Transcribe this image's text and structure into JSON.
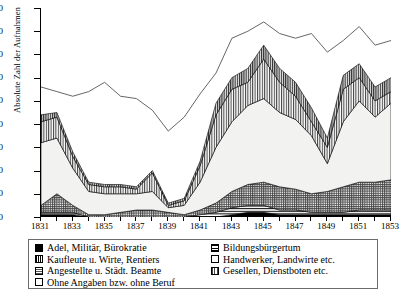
{
  "chart_data": {
    "type": "area",
    "title": "",
    "xlabel": "",
    "ylabel": "Absolute Zahl der Aufnahmen",
    "ylim": [
      0,
      90
    ],
    "yticks": [
      0,
      10,
      20,
      30,
      40,
      50,
      60,
      70,
      80,
      90
    ],
    "xlim": [
      1831,
      1853
    ],
    "x": [
      1831,
      1832,
      1833,
      1834,
      1835,
      1836,
      1837,
      1838,
      1839,
      1840,
      1841,
      1842,
      1843,
      1844,
      1845,
      1846,
      1847,
      1848,
      1849,
      1850,
      1851,
      1852,
      1853
    ],
    "xticks": [
      1831,
      1833,
      1835,
      1837,
      1839,
      1841,
      1843,
      1845,
      1847,
      1849,
      1851,
      1853
    ],
    "xticklabels": [
      "1831",
      "1833",
      "1835",
      "1837",
      "1839",
      "1841",
      "1843",
      "1845",
      "1847",
      "1849",
      "1851",
      "1853"
    ],
    "stacked": true,
    "grid": false,
    "legend_position": "below",
    "series": [
      {
        "name": "Adel, Militär, Bürokratie",
        "pattern": "solid-black",
        "values": [
          1,
          1,
          1,
          0,
          0,
          0,
          0,
          0,
          0,
          0,
          0,
          0,
          1,
          2,
          2,
          1,
          1,
          1,
          1,
          1,
          1,
          1,
          1
        ]
      },
      {
        "name": "Bildungsbürgertum",
        "pattern": "horizontal-lines",
        "values": [
          1,
          1,
          1,
          0,
          0,
          0,
          0,
          0,
          0,
          0,
          1,
          2,
          3,
          3,
          3,
          2,
          2,
          1,
          1,
          1,
          2,
          2,
          2
        ]
      },
      {
        "name": "Angestellte u. Städt. Beamte",
        "pattern": "fine-cross-hatch",
        "values": [
          3,
          8,
          3,
          1,
          1,
          2,
          3,
          3,
          2,
          1,
          2,
          4,
          7,
          9,
          10,
          10,
          9,
          8,
          9,
          11,
          12,
          12,
          13
        ]
      },
      {
        "name": "Handwerker, Landwirte etc.",
        "pattern": "white",
        "values": [
          27,
          24,
          16,
          10,
          9,
          8,
          7,
          8,
          2,
          4,
          12,
          24,
          30,
          34,
          36,
          32,
          30,
          25,
          12,
          28,
          35,
          28,
          33
        ]
      },
      {
        "name": "Gesellen, Dienstboten etc.",
        "pattern": "vertical-lines",
        "values": [
          9,
          9,
          5,
          3,
          3,
          3,
          2,
          8,
          1,
          2,
          7,
          14,
          14,
          10,
          17,
          13,
          10,
          6,
          7,
          14,
          10,
          7,
          5
        ]
      },
      {
        "name": "Kaufleute u. Wirte, Rentiers",
        "pattern": "vertical-lines-dark",
        "values": [
          3,
          2,
          2,
          1,
          1,
          1,
          1,
          1,
          1,
          1,
          2,
          5,
          5,
          6,
          6,
          6,
          6,
          6,
          4,
          6,
          6,
          6,
          6
        ]
      }
    ],
    "total_line": {
      "name": "Gesamt",
      "values": [
        56,
        54,
        52,
        54,
        58,
        52,
        51,
        46,
        37,
        43,
        53,
        62,
        77,
        80,
        84,
        79,
        77,
        79,
        71,
        76,
        82,
        74,
        76
      ]
    },
    "legend_left": [
      {
        "label": "Adel, Militär, Bürokratie",
        "swatch": "solid-black"
      },
      {
        "label": "Kaufleute u. Wirte, Rentiers",
        "swatch": "vertical-lines-dark"
      },
      {
        "label": "Angestellte u. Städt. Beamte",
        "swatch": "fine-cross-hatch"
      },
      {
        "label": "Ohne Angaben bzw. ohne Beruf",
        "swatch": "white"
      }
    ],
    "legend_right": [
      {
        "label": "Bildungsbürgertum",
        "swatch": "horizontal-lines"
      },
      {
        "label": "Handwerker, Landwirte etc.",
        "swatch": "white"
      },
      {
        "label": "Gesellen, Dienstboten etc.",
        "swatch": "vertical-lines"
      }
    ]
  }
}
